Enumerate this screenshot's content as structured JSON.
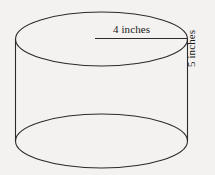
{
  "figure": {
    "shape": "cylinder",
    "background_color": "#f3f2f0",
    "stroke_color": "#2b2b2b",
    "text_color": "#1a1a1a",
    "labels": {
      "diameter": "4 inches",
      "height": "5 inches"
    },
    "geometry": {
      "center_x": 101.5,
      "radius_x": 86,
      "radius_y": 27,
      "top_center_y": 39,
      "bottom_center_y": 141,
      "left_wall_x": 15.5,
      "right_wall_x": 187.5,
      "radius_line_start_x": 95,
      "radius_line_y": 39
    }
  }
}
